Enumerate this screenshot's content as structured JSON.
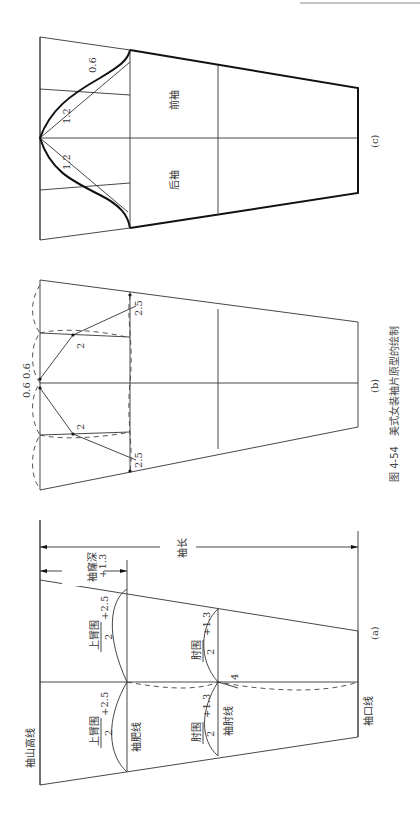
{
  "caption": {
    "number": "图 4-54",
    "title": "美式女装袖片原型的绘制"
  },
  "panels": {
    "a": {
      "label": "(a)",
      "sleeve_cap_height_line": "袖山高线",
      "biceps_line": "袖肥线",
      "elbow_line": "袖肘线",
      "cuff_line": "袖口线",
      "sleeve_length": "袖长",
      "armhole_depth": "袖窿深",
      "armhole_depth_add": "+1.3",
      "upper_arm_numerator": "上臂围",
      "upper_arm_denominator": "2",
      "upper_arm_add": "+2.5",
      "elbow_numerator": "肘围",
      "elbow_denominator": "2",
      "elbow_add": "+1.3",
      "elbow_offset": "4"
    },
    "b": {
      "label": "(b)",
      "top_offsets": "0.6 0.6",
      "diag_mark_left": "2",
      "diag_mark_right": "2",
      "end_mark_left": "2.5",
      "end_mark_right": "2.5"
    },
    "c": {
      "label": "(c)",
      "front_sleeve": "前袖",
      "back_sleeve": "后袖",
      "curve_front_1": "1.2",
      "curve_front_2": "0.6",
      "curve_back_1": "1.2"
    }
  },
  "colors": {
    "line": "#333333",
    "bold_line": "#111111",
    "background": "#ffffff"
  }
}
